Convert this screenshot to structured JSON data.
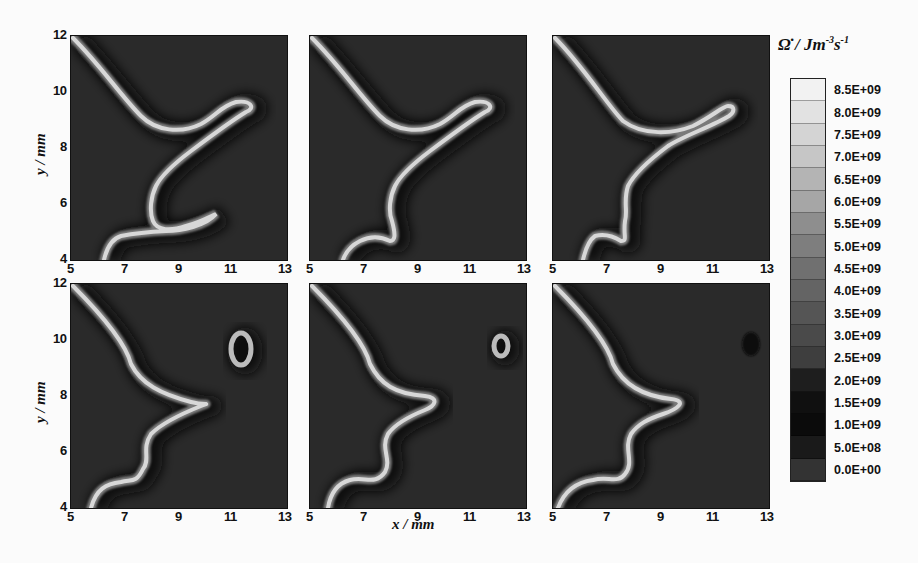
{
  "chart_data": {
    "type": "heatmap",
    "layout": {
      "rows": 2,
      "cols": 3
    },
    "xlabel": "x / mm",
    "ylabel": "y / mm",
    "xlim": [
      5,
      13
    ],
    "ylim": [
      4,
      12
    ],
    "x_ticks": [
      "5",
      "7",
      "9",
      "11",
      "13"
    ],
    "y_ticks": [
      "4",
      "6",
      "8",
      "10",
      "12"
    ],
    "colorbar": {
      "label": "Ω̇ / Jm⁻³s⁻¹",
      "label_main": "Ω̇ / Jm",
      "label_exp1": "-3",
      "label_s": "s",
      "label_exp2": "-1",
      "levels": [
        "8.5E+09",
        "8.0E+09",
        "7.5E+09",
        "7.0E+09",
        "6.5E+09",
        "6.0E+09",
        "5.5E+09",
        "5.0E+09",
        "4.5E+09",
        "4.0E+09",
        "3.5E+09",
        "3.0E+09",
        "2.5E+09",
        "2.0E+09",
        "1.5E+09",
        "1.0E+09",
        "5.0E+08",
        "0.0E+00"
      ],
      "colors": [
        "#f2f2f2",
        "#e2e2e2",
        "#d4d4d4",
        "#c6c6c6",
        "#b4b4b4",
        "#a6a6a6",
        "#8e8e8e",
        "#7e7e7e",
        "#707070",
        "#646464",
        "#555555",
        "#4a4a4a",
        "#3e3e3e",
        "#1e1e1e",
        "#101010",
        "#0b0b0b",
        "#1a1a1a",
        "#333333"
      ]
    },
    "panels": [
      {
        "id": "a",
        "row": 0,
        "col": 0,
        "description": "Flame front Y-shaped, closed loop near (10.5,10.3), hook near (9,5.3)"
      },
      {
        "id": "b",
        "row": 0,
        "col": 1,
        "description": "Loop at (10.5,10.3) thinning, lower hook retracting near (7.5,4.7)"
      },
      {
        "id": "c",
        "row": 0,
        "col": 2,
        "description": "Upper branch merging with loop around (9.5,9)"
      },
      {
        "id": "d",
        "row": 1,
        "col": 0,
        "description": "Pocket separated near (11.3,10.2), cusp at (9.5,8.5)"
      },
      {
        "id": "e",
        "row": 1,
        "col": 1,
        "description": "Small pocket near (12,10.2) shrinking, cusp at (9.3,8.1)"
      },
      {
        "id": "f",
        "row": 1,
        "col": 2,
        "description": "Pocket burnt out (dark spot near 12.3,10.1), cusp at (9.2,8.0)"
      }
    ]
  },
  "panel_paths": [
    "M2,2 C30,30 50,60 70,80 C85,95 110,98 130,88 C145,80 150,70 165,66 C180,64 185,72 175,76 C160,85 140,100 120,115 C100,130 90,140 85,150 C80,160 78,175 82,185 C86,195 100,195 115,190 C130,186 140,180 145,178 C135,190 110,195 95,195 C75,196 60,198 50,200 C40,203 35,215 33,224",
    "M2,2 C30,30 50,60 70,80 C85,95 110,98 130,88 C145,80 150,70 165,66 C180,64 185,72 175,76 C160,85 140,100 120,115 C100,130 90,140 85,150 C80,160 78,175 82,185 C86,200 85,205 80,205 C70,200 60,200 50,205 C40,210 35,218 33,224",
    "M2,2 C30,30 55,70 70,85 C90,100 120,98 140,90 C160,80 170,70 175,70 C182,70 182,76 176,80 C160,90 130,100 115,110 C95,125 80,140 75,150 C70,165 75,175 72,185 C70,200 75,205 68,205 C60,200 50,198 42,200 C35,205 32,215 30,224",
    "M2,2 C30,30 55,60 60,80 C70,100 90,110 120,118 C135,122 140,118 130,122 C110,130 90,140 80,150 C70,165 80,175 72,185 C65,200 60,195 50,198 C35,200 25,205 20,224",
    "M2,2 C30,30 55,60 60,80 C70,100 85,110 115,112 C130,114 125,122 115,126 C100,132 85,140 78,150 C70,165 82,175 75,188 C65,202 55,192 40,196 C25,200 20,212 18,224",
    "M2,2 C30,30 55,60 60,80 C70,100 90,112 118,115 C135,117 125,125 110,130 C95,135 85,140 78,150 C70,165 82,178 72,190 C65,200 55,192 40,196 C25,198 12,205 5,224"
  ],
  "panel_pockets": [
    {
      "cx": 172,
      "cy": 72,
      "rx": 0,
      "ry": 0
    },
    {
      "cx": 172,
      "cy": 72,
      "rx": 0,
      "ry": 0
    },
    {
      "cx": 172,
      "cy": 72,
      "rx": 0,
      "ry": 0
    },
    {
      "cx": 170,
      "cy": 65,
      "rx": 10,
      "ry": 16
    },
    {
      "cx": 191,
      "cy": 62,
      "rx": 7,
      "ry": 10
    },
    {
      "cx": 0,
      "cy": 0,
      "rx": 0,
      "ry": 0
    }
  ]
}
